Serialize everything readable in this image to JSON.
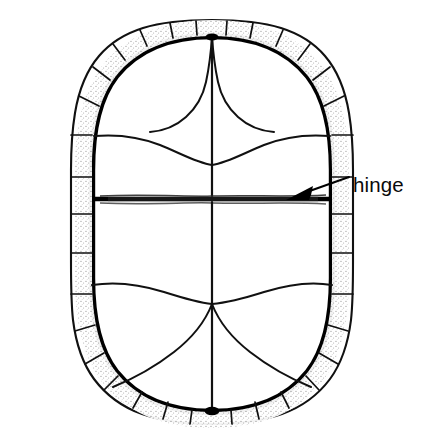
{
  "figure": {
    "kind": "scientific-line-illustration",
    "view": "ventral",
    "background_color": "#ffffff",
    "ink_color": "#000000",
    "stipple_color": "#9a9a9a"
  },
  "annotations": [
    {
      "id": "hinge",
      "label": "hinge",
      "label_x": 353,
      "label_y": 192,
      "leader": {
        "type": "arrow",
        "from_x": 349,
        "from_y": 177,
        "to_x": 288,
        "to_y": 199
      }
    }
  ],
  "labels": {
    "hinge": "hinge"
  },
  "structure": {
    "outline_note": "rounded-rectangular oval plastron outline",
    "rim_note": "thick black inner rim with stippled shading",
    "marginal_scutes_count": 24,
    "hinge_note": "dark horizontal band bisecting plastron into anterior and posterior lobes",
    "central_seam_note": "vertical midline seam running full height"
  },
  "colors": {
    "ink": "#000000",
    "rim": "#000000",
    "stipple": "#9e9e9e",
    "seam": "#111111",
    "background": "#ffffff"
  }
}
